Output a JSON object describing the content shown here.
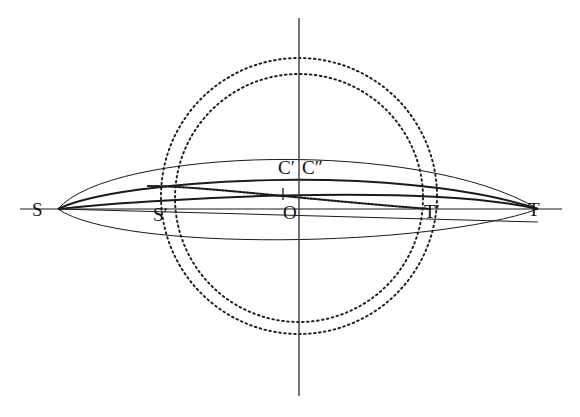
{
  "figure": {
    "kind": "geometric-construction",
    "background_color": "#ffffff",
    "ink_color": "#1a1a1a",
    "width": 580,
    "height": 417,
    "labels": [
      {
        "id": "S",
        "text": "S",
        "x": 32,
        "y": 210
      },
      {
        "id": "S-prime",
        "text": "S′",
        "x": 153,
        "y": 215
      },
      {
        "id": "O",
        "text": "O",
        "x": 283,
        "y": 213
      },
      {
        "id": "C-prime",
        "text": "C′",
        "x": 278,
        "y": 168
      },
      {
        "id": "C-second",
        "text": "C″",
        "x": 303,
        "y": 168
      },
      {
        "id": "T-prime",
        "text": "T′",
        "x": 424,
        "y": 212
      },
      {
        "id": "T",
        "text": "T",
        "x": 528,
        "y": 210
      }
    ],
    "points": {
      "S": {
        "x": 58,
        "y": 209
      },
      "T": {
        "x": 538,
        "y": 209
      },
      "O": {
        "x": 299,
        "y": 209
      },
      "S_prime": {
        "x": 168,
        "y": 209
      },
      "T_prime": {
        "x": 430,
        "y": 209
      },
      "C_prime": {
        "x": 290,
        "y": 182
      },
      "C_second": {
        "x": 312,
        "y": 183
      }
    },
    "axes": {
      "horizontal": {
        "x1": 20,
        "y1": 209,
        "x2": 562,
        "y2": 209,
        "stroke_width": 1.1
      },
      "vertical": {
        "x1": 299,
        "y1": 18,
        "x2": 299,
        "y2": 396,
        "stroke_width": 1.4
      }
    },
    "circles": [
      {
        "name": "outer-dotted-circle",
        "cx": 299,
        "cy": 196,
        "r": 138,
        "dash": "1.6 3.4",
        "stroke_width": 1.9
      },
      {
        "name": "inner-dotted-circle",
        "cx": 299,
        "cy": 198,
        "r": 124,
        "dash": "1.6 3.4",
        "stroke_width": 1.9
      }
    ],
    "curves": [
      {
        "name": "lens-upper-arc",
        "peak_y": 152,
        "stroke_width": 1.0,
        "style": "solid"
      },
      {
        "name": "lens-lower-arc",
        "peak_y": 237,
        "stroke_width": 1.0,
        "style": "solid"
      },
      {
        "name": "upper-heavy-arc",
        "peak_y": 176,
        "stroke_width": 2.0,
        "style": "solid"
      },
      {
        "name": "lower-heavy-arc",
        "peak_y": 196,
        "stroke_width": 2.0,
        "style": "solid"
      },
      {
        "name": "dotted-descending-arc",
        "stroke_width": 2.1,
        "style": "dotted",
        "dash": "1.7 1.7"
      },
      {
        "name": "slanted-chord",
        "stroke_width": 1.1,
        "style": "solid"
      }
    ],
    "tick": {
      "name": "axis-tick-mark",
      "x": 283,
      "y_top": 188,
      "y_bottom": 200
    }
  }
}
